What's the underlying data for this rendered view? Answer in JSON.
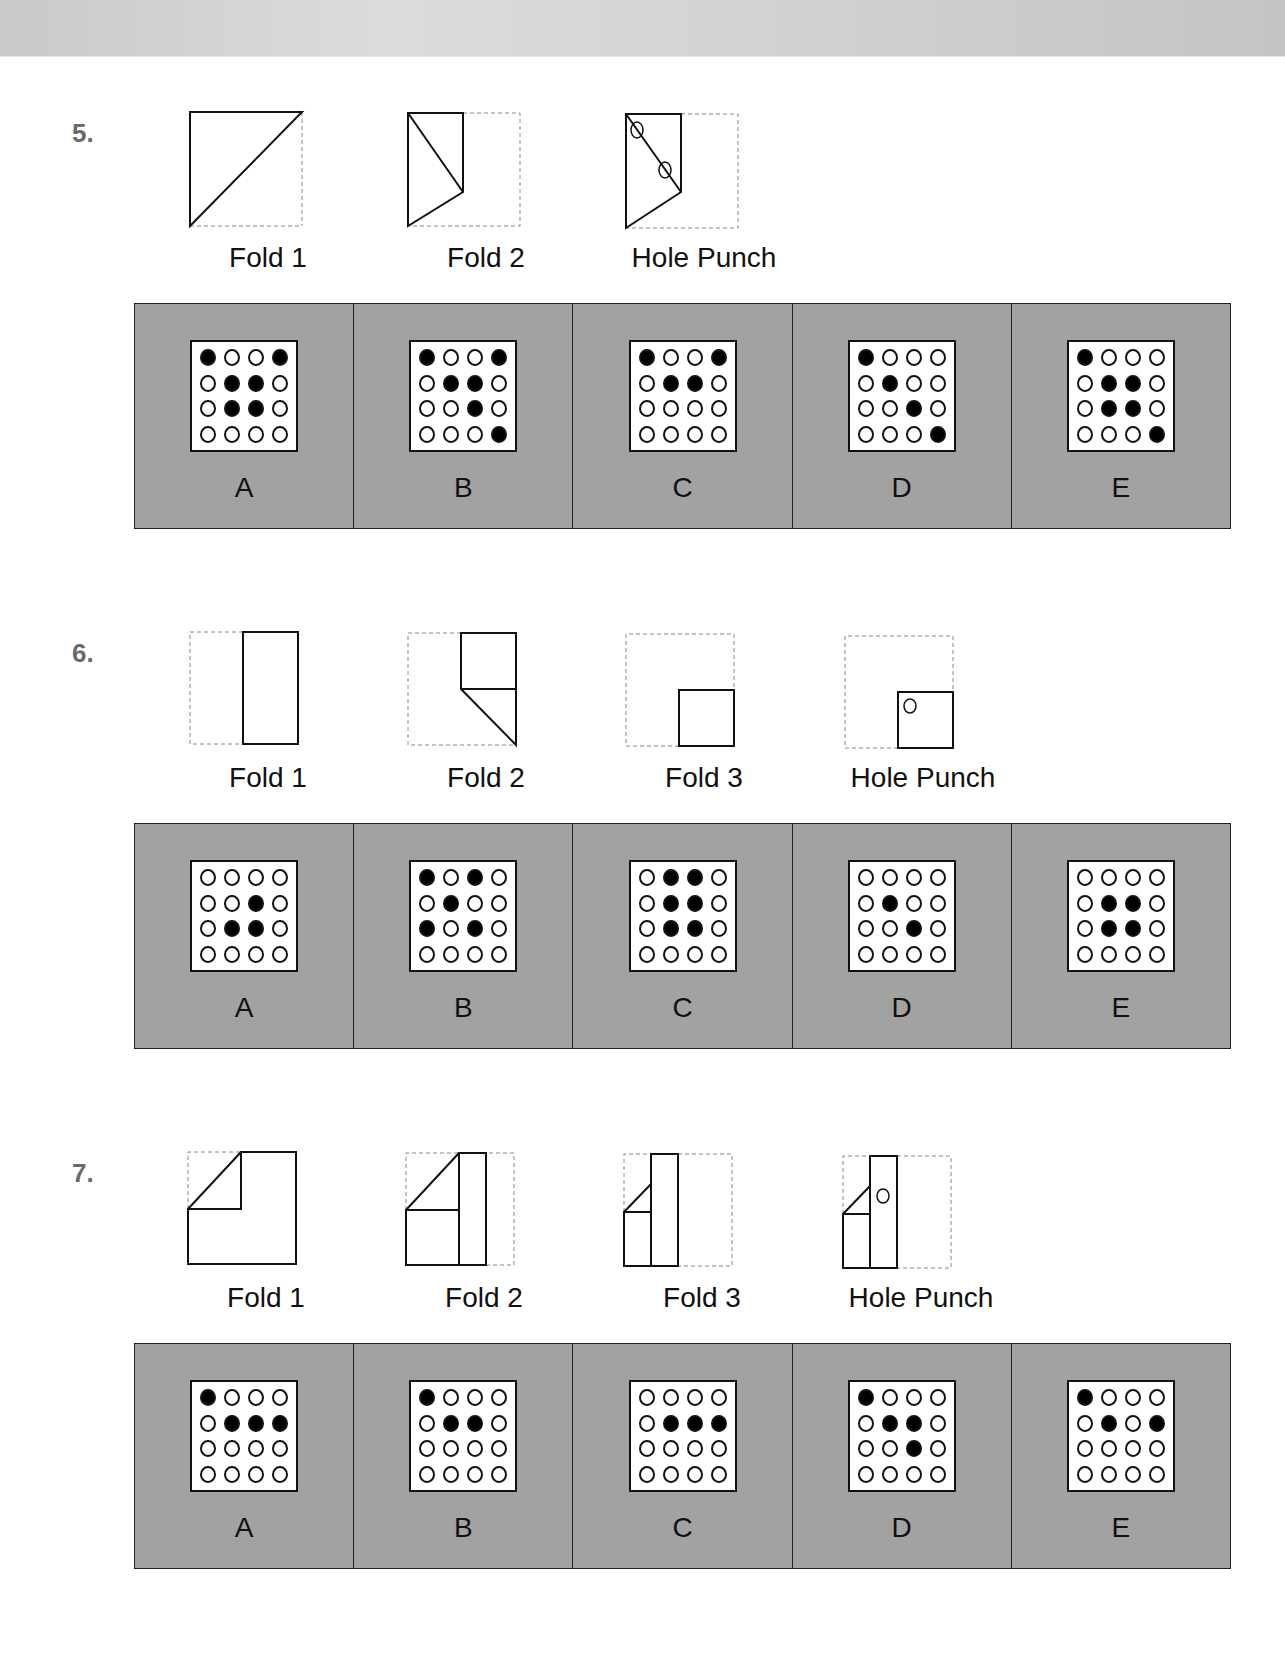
{
  "questions": [
    {
      "number": "5.",
      "steps": [
        {
          "label": "Fold 1",
          "figure": "q5-fold1"
        },
        {
          "label": "Fold 2",
          "figure": "q5-fold2"
        },
        {
          "label": "Hole Punch",
          "figure": "q5-punch"
        }
      ],
      "options": [
        {
          "label": "A",
          "grid": [
            [
              1,
              0,
              0,
              1
            ],
            [
              0,
              1,
              1,
              0
            ],
            [
              0,
              1,
              1,
              0
            ],
            [
              0,
              0,
              0,
              0
            ]
          ]
        },
        {
          "label": "B",
          "grid": [
            [
              1,
              0,
              0,
              1
            ],
            [
              0,
              1,
              1,
              0
            ],
            [
              0,
              0,
              1,
              0
            ],
            [
              0,
              0,
              0,
              1
            ]
          ]
        },
        {
          "label": "C",
          "grid": [
            [
              1,
              0,
              0,
              1
            ],
            [
              0,
              1,
              1,
              0
            ],
            [
              0,
              0,
              0,
              0
            ],
            [
              0,
              0,
              0,
              0
            ]
          ]
        },
        {
          "label": "D",
          "grid": [
            [
              1,
              0,
              0,
              0
            ],
            [
              0,
              1,
              0,
              0
            ],
            [
              0,
              0,
              1,
              0
            ],
            [
              0,
              0,
              0,
              1
            ]
          ]
        },
        {
          "label": "E",
          "grid": [
            [
              1,
              0,
              0,
              0
            ],
            [
              0,
              1,
              1,
              0
            ],
            [
              0,
              1,
              1,
              0
            ],
            [
              0,
              0,
              0,
              1
            ]
          ]
        }
      ]
    },
    {
      "number": "6.",
      "steps": [
        {
          "label": "Fold 1",
          "figure": "q6-fold1"
        },
        {
          "label": "Fold 2",
          "figure": "q6-fold2"
        },
        {
          "label": "Fold 3",
          "figure": "q6-fold3"
        },
        {
          "label": "Hole Punch",
          "figure": "q6-punch"
        }
      ],
      "options": [
        {
          "label": "A",
          "grid": [
            [
              0,
              0,
              0,
              0
            ],
            [
              0,
              0,
              1,
              0
            ],
            [
              0,
              1,
              1,
              0
            ],
            [
              0,
              0,
              0,
              0
            ]
          ]
        },
        {
          "label": "B",
          "grid": [
            [
              1,
              0,
              1,
              0
            ],
            [
              0,
              1,
              0,
              0
            ],
            [
              1,
              0,
              1,
              0
            ],
            [
              0,
              0,
              0,
              0
            ]
          ]
        },
        {
          "label": "C",
          "grid": [
            [
              0,
              1,
              1,
              0
            ],
            [
              0,
              1,
              1,
              0
            ],
            [
              0,
              1,
              1,
              0
            ],
            [
              0,
              0,
              0,
              0
            ]
          ]
        },
        {
          "label": "D",
          "grid": [
            [
              0,
              0,
              0,
              0
            ],
            [
              0,
              1,
              0,
              0
            ],
            [
              0,
              0,
              1,
              0
            ],
            [
              0,
              0,
              0,
              0
            ]
          ]
        },
        {
          "label": "E",
          "grid": [
            [
              0,
              0,
              0,
              0
            ],
            [
              0,
              1,
              1,
              0
            ],
            [
              0,
              1,
              1,
              0
            ],
            [
              0,
              0,
              0,
              0
            ]
          ]
        }
      ]
    },
    {
      "number": "7.",
      "steps": [
        {
          "label": "Fold 1",
          "figure": "q7-fold1"
        },
        {
          "label": "Fold 2",
          "figure": "q7-fold2"
        },
        {
          "label": "Fold 3",
          "figure": "q7-fold3"
        },
        {
          "label": "Hole Punch",
          "figure": "q7-punch"
        }
      ],
      "options": [
        {
          "label": "A",
          "grid": [
            [
              1,
              0,
              0,
              0
            ],
            [
              0,
              1,
              1,
              1
            ],
            [
              0,
              0,
              0,
              0
            ],
            [
              0,
              0,
              0,
              0
            ]
          ]
        },
        {
          "label": "B",
          "grid": [
            [
              1,
              0,
              0,
              0
            ],
            [
              0,
              1,
              1,
              0
            ],
            [
              0,
              0,
              0,
              0
            ],
            [
              0,
              0,
              0,
              0
            ]
          ]
        },
        {
          "label": "C",
          "grid": [
            [
              0,
              0,
              0,
              0
            ],
            [
              0,
              1,
              1,
              1
            ],
            [
              0,
              0,
              0,
              0
            ],
            [
              0,
              0,
              0,
              0
            ]
          ]
        },
        {
          "label": "D",
          "grid": [
            [
              1,
              0,
              0,
              0
            ],
            [
              0,
              1,
              1,
              0
            ],
            [
              0,
              0,
              1,
              0
            ],
            [
              0,
              0,
              0,
              0
            ]
          ]
        },
        {
          "label": "E",
          "grid": [
            [
              1,
              0,
              0,
              0
            ],
            [
              0,
              1,
              0,
              1
            ],
            [
              0,
              0,
              0,
              0
            ],
            [
              0,
              0,
              0,
              0
            ]
          ]
        }
      ]
    }
  ],
  "colors": {
    "panel_bg": "#a2a2a2",
    "qnum": "#6a6a6a",
    "ink": "#111111"
  }
}
